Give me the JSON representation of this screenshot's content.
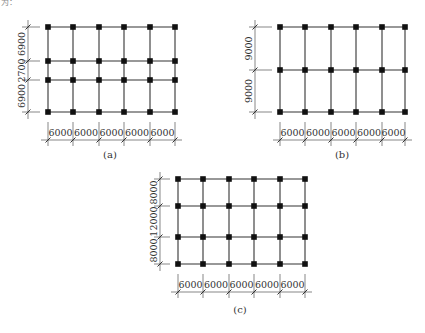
{
  "header_fragment": "为：",
  "figures": [
    {
      "id": "a",
      "caption": "(a)",
      "bays_x": [
        "6000",
        "6000",
        "6000",
        "6000",
        "6000"
      ],
      "bays_y_top_to_bottom": [
        "6900",
        "2700",
        "6900"
      ],
      "grid": {
        "cols_x": [
          48,
          73,
          99,
          124,
          150,
          175
        ],
        "rows_y": [
          27,
          61,
          80,
          112
        ]
      },
      "dim_y": 140,
      "dim_x": 28,
      "caption_pos": [
        110,
        158
      ]
    },
    {
      "id": "b",
      "caption": "(b)",
      "bays_x": [
        "6000",
        "6000",
        "6000",
        "6000",
        "6000"
      ],
      "bays_y_top_to_bottom": [
        "9000",
        "9000"
      ],
      "grid": {
        "cols_x": [
          280,
          305,
          331,
          356,
          382,
          405
        ],
        "rows_y": [
          27,
          70,
          112
        ]
      },
      "dim_y": 140,
      "dim_x": 255,
      "caption_pos": [
        342,
        158
      ]
    },
    {
      "id": "c",
      "caption": "(c)",
      "bays_x": [
        "6000",
        "6000",
        "6000",
        "6000",
        "6000"
      ],
      "bays_y_top_to_bottom": [
        "8000",
        "12000",
        "8000"
      ],
      "grid": {
        "cols_x": [
          178,
          203,
          229,
          254,
          280,
          305
        ],
        "rows_y": [
          179,
          206,
          237,
          264
        ]
      },
      "dim_y": 292,
      "dim_x": 160,
      "caption_pos": [
        240,
        313
      ]
    }
  ]
}
